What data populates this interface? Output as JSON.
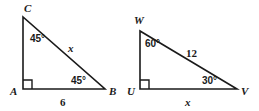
{
  "figure": {
    "type": "geometry-diagram",
    "stroke_color": "#1a1a1a",
    "background_color": "#ffffff",
    "triangles": [
      {
        "name": "triangle-abc",
        "vertices": [
          {
            "label": "C",
            "x": 23,
            "y": 17,
            "label_x": 24,
            "label_y": 12
          },
          {
            "label": "A",
            "x": 23,
            "y": 89,
            "label_x": 10,
            "label_y": 95
          },
          {
            "label": "B",
            "x": 105,
            "y": 89,
            "label_x": 109,
            "label_y": 95
          }
        ],
        "right_angle_at": "A",
        "angles": [
          {
            "at": "C",
            "value": "45°",
            "label_x": 30,
            "label_y": 42
          },
          {
            "at": "B",
            "value": "45°",
            "label_x": 71,
            "label_y": 84
          }
        ],
        "sides": [
          {
            "name": "hypotenuse",
            "value": "x",
            "italic": true,
            "label_x": 68,
            "label_y": 52
          },
          {
            "name": "base",
            "value": "6",
            "italic": false,
            "label_x": 60,
            "label_y": 106
          }
        ]
      },
      {
        "name": "triangle-uvw",
        "vertices": [
          {
            "label": "W",
            "x": 140,
            "y": 31,
            "label_x": 134,
            "label_y": 24
          },
          {
            "label": "U",
            "x": 140,
            "y": 89,
            "label_x": 127,
            "label_y": 95
          },
          {
            "label": "V",
            "x": 237,
            "y": 89,
            "label_x": 241,
            "label_y": 95
          }
        ],
        "right_angle_at": "U",
        "angles": [
          {
            "at": "W",
            "value": "60°",
            "label_x": 145,
            "label_y": 47
          },
          {
            "at": "V",
            "value": "30°",
            "label_x": 202,
            "label_y": 84
          }
        ],
        "sides": [
          {
            "name": "hypotenuse",
            "value": "12",
            "italic": false,
            "label_x": 186,
            "label_y": 57
          },
          {
            "name": "base",
            "value": "x",
            "italic": true,
            "label_x": 185,
            "label_y": 106
          }
        ]
      }
    ]
  }
}
